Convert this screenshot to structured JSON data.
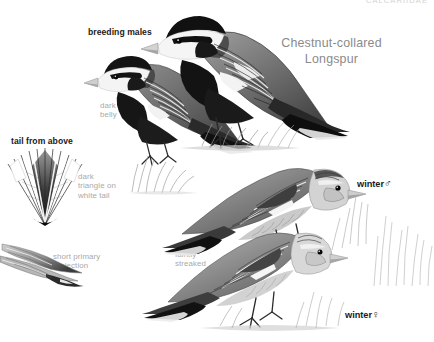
{
  "plate": {
    "family_heading": "CALCARIIDAE",
    "species_title": "Chestnut-collared\nLongspur",
    "labels": {
      "breeding_males": "breeding males",
      "dark_belly": "dark\nbelly",
      "tail_from_above": "tail from above",
      "dark_triangle": "dark\ntriangle on\nwhite tail",
      "short_primary": "short primary\nprojection",
      "faintly_streaked": "faintly\nstreaked",
      "winter_male": "winter",
      "winter_female": "winter",
      "male_symbol": "♂",
      "female_symbol": "♀"
    },
    "figures": {
      "breeding_male_front": "breeding-male-longspur-front",
      "breeding_male_rear": "breeding-male-longspur-rear",
      "winter_male_bird": "winter-male-longspur",
      "winter_female_bird": "winter-female-longspur",
      "tail_fan": "spread-tail-from-above",
      "folded_wing": "folded-wing-primary-projection"
    },
    "colors": {
      "background": "#ffffff",
      "ink_black": "#1b1b1b",
      "label_gray": "#a9a9a9",
      "title_gray": "#8a8a8a",
      "family_gray": "#d2d2d2"
    }
  }
}
